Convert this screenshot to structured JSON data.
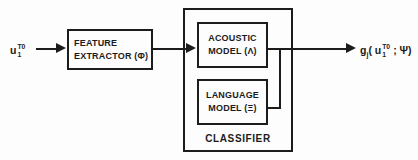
{
  "diagram": {
    "input_label": {
      "base": "u",
      "sup": "T0",
      "sub": "1"
    },
    "feature_extractor": {
      "line1": "FEATURE",
      "line2": "EXTRACTOR (Φ)"
    },
    "acoustic_model": {
      "line1": "ACOUSTIC",
      "line2": "MODEL (Λ)"
    },
    "language_model": {
      "line1": "LANGUAGE",
      "line2": "MODEL (Ξ)"
    },
    "classifier": {
      "label": "CLASSIFIER"
    },
    "output_label": {
      "base": "g",
      "base_sub": "j",
      "open": "( u",
      "sup": "T0",
      "sub": "1",
      "close": "; Ψ)"
    }
  },
  "colors": {
    "line": "#1c1c1c",
    "text": "#1c1c1c",
    "bg": "#fdfdfd"
  }
}
